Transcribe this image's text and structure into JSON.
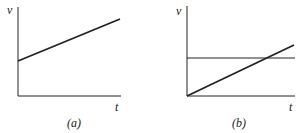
{
  "figure": {
    "panels": [
      {
        "id": "a",
        "caption": "(a)",
        "y_axis_label": "v",
        "x_axis_label": "t",
        "lines": [
          {
            "name": "velocity",
            "description": "straight line with positive initial value and positive slope"
          }
        ]
      },
      {
        "id": "b",
        "caption": "(b)",
        "y_axis_label": "v",
        "x_axis_label": "t",
        "lines": [
          {
            "name": "constant-velocity",
            "description": "horizontal line"
          },
          {
            "name": "accelerating-velocity",
            "description": "straight line from origin with positive slope crossing the horizontal line"
          }
        ]
      }
    ],
    "colors": {
      "ink": "#222222",
      "background": "#ffffff"
    }
  }
}
